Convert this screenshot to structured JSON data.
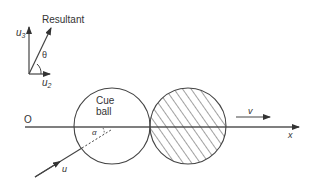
{
  "diagram": {
    "vector_inset": {
      "resultant_label": "Resultant",
      "u3_label": "u",
      "u3_sub": "3",
      "u2_label": "u",
      "u2_sub": "2",
      "theta_label": "θ"
    },
    "main": {
      "origin_label": "O",
      "x_axis_label": "x",
      "cue_ball_label_line1": "Cue",
      "cue_ball_label_line2": "ball",
      "alpha_label": "α",
      "u_label": "u",
      "v_label": "v"
    },
    "colors": {
      "line": "#444444",
      "text": "#333333",
      "background": "#ffffff"
    }
  }
}
